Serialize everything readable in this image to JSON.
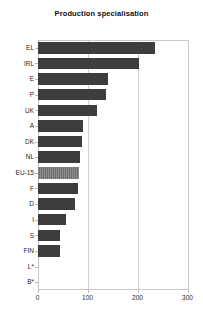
{
  "chart_data": {
    "type": "bar",
    "orientation": "horizontal",
    "title": "Production specialisation",
    "xlabel": "",
    "ylabel": "",
    "xlim": [
      0,
      300
    ],
    "xticks": [
      0,
      100,
      200,
      300
    ],
    "xtick_labels": [
      "0",
      "100",
      "200",
      "300"
    ],
    "grid": true,
    "legend": false,
    "categories": [
      "EL",
      "IRL",
      "E",
      "P",
      "UK",
      "A",
      "DK",
      "NL",
      "EU-15",
      "F",
      "D",
      "I",
      "S",
      "FIN",
      "L*",
      "B*"
    ],
    "values": [
      234,
      202,
      140,
      136,
      118,
      90,
      88,
      85,
      82,
      80,
      74,
      56,
      45,
      44,
      0,
      0
    ],
    "highlight_category": "EU-15",
    "colors": {
      "bar": "#3d3d3d",
      "highlight_bar": "#8c8c8c",
      "grid": "#cfcfcf",
      "axis": "#c9c9c9",
      "text": "#2a2a2a",
      "background": "#ffffff"
    }
  }
}
